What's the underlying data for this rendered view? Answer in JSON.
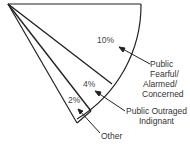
{
  "diagram": {
    "type": "pie-wedge",
    "segments": [
      {
        "label": "Public Fearful/ Alarmed/ Concerned",
        "value": "10%"
      },
      {
        "label": "Public Outraged Indignant",
        "value": "4%"
      },
      {
        "label": "Other",
        "value": "2%"
      }
    ],
    "callouts": {
      "fearful": [
        "Public",
        "Fearful/",
        "Alarmed/",
        "Concerned"
      ],
      "outraged": [
        "Public Outraged",
        "Indignant"
      ],
      "other": [
        "Other"
      ]
    },
    "colors": {
      "stroke": "#222222",
      "text": "#333333",
      "background": "#ffffff"
    }
  }
}
